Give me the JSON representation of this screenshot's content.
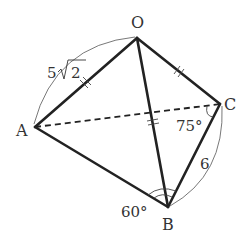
{
  "figure": {
    "type": "triangular pyramid (tetrahedron) O-ABC",
    "vertices": {
      "O": {
        "label": "O",
        "x": 137,
        "y": 38
      },
      "A": {
        "label": "A",
        "x": 35,
        "y": 127
      },
      "B": {
        "label": "B",
        "x": 168,
        "y": 207
      },
      "C": {
        "label": "C",
        "x": 220,
        "y": 104
      }
    },
    "edges": [
      {
        "from": "O",
        "to": "A",
        "style": "solid",
        "tick": "double"
      },
      {
        "from": "O",
        "to": "B",
        "style": "solid",
        "tick": "double"
      },
      {
        "from": "O",
        "to": "C",
        "style": "solid",
        "tick": "double"
      },
      {
        "from": "A",
        "to": "B",
        "style": "solid"
      },
      {
        "from": "B",
        "to": "C",
        "style": "solid"
      },
      {
        "from": "A",
        "to": "C",
        "style": "dashed"
      }
    ],
    "measurements": {
      "OA": "5√2",
      "OA_coef": "5",
      "OA_radicand": "2",
      "BC": "6",
      "angle_ABC": "60°",
      "angle_ACB": "75°"
    },
    "colors": {
      "line": "#222222",
      "text": "#333333",
      "background": "#ffffff"
    }
  }
}
